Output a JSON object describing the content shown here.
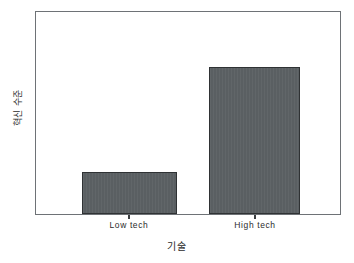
{
  "chart_data": {
    "type": "bar",
    "title": "",
    "xlabel": "기술",
    "ylabel": "혁신 수준",
    "categories": [
      "Low tech",
      "High tech"
    ],
    "values": [
      21,
      73
    ],
    "ylim": [
      0,
      100
    ],
    "grid": false,
    "legend": "none",
    "axis_tick_labels_y": [],
    "bar_color": "#5a5f62",
    "bar_edge_color": "#2f3234",
    "frame_color": "#6e7276",
    "background_color": "#ffffff"
  },
  "bars": [
    {
      "label": "Low tech",
      "value_pct": 21,
      "left_pct": 15.0,
      "width_pct": 31.4,
      "center_pct": 30.7
    },
    {
      "label": "High tech",
      "value_pct": 73,
      "left_pct": 56.9,
      "width_pct": 30.1,
      "center_pct": 71.9
    }
  ]
}
